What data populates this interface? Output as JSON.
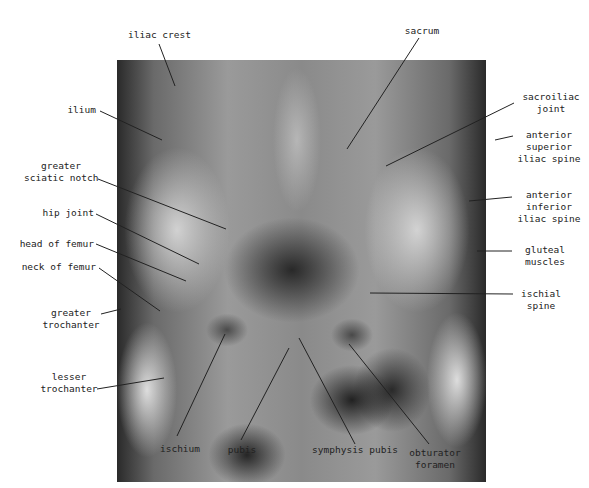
{
  "figure": {
    "labels": {
      "iliac_crest": "iliac crest",
      "ilium": "ilium",
      "greater_sciatic_notch_1": "greater",
      "greater_sciatic_notch_2": "sciatic notch",
      "hip_joint": "hip joint",
      "head_of_femur": "head of femur",
      "neck_of_femur": "neck of femur",
      "greater_trochanter_1": "greater",
      "greater_trochanter_2": "trochanter",
      "lesser_trochanter_1": "lesser",
      "lesser_trochanter_2": "trochanter",
      "ischium": "ischium",
      "pubis": "pubis",
      "symphysis_pubis": "symphysis pubis",
      "obturator_foramen_1": "obturator",
      "obturator_foramen_2": "foramen",
      "sacrum": "sacrum",
      "sacroiliac_joint_1": "sacroiliac",
      "sacroiliac_joint_2": "joint",
      "asis_1": "anterior",
      "asis_2": "superior",
      "asis_3": "iliac spine",
      "aiis_1": "anterior",
      "aiis_2": "inferior",
      "aiis_3": "iliac spine",
      "gluteal_muscles_1": "gluteal",
      "gluteal_muscles_2": "muscles",
      "ischial_spine_1": "ischial",
      "ischial_spine_2": "spine"
    }
  }
}
